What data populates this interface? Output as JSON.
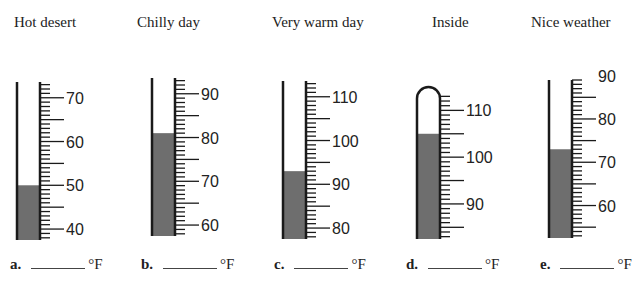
{
  "fill_color": "#6e6e6e",
  "line_color": "#1a1a1a",
  "thermometers": [
    {
      "id": "a",
      "title": "Hot desert",
      "letter": "a.",
      "unit": "°F",
      "reading": 50,
      "scale_min": 37.5,
      "scale_max": 73.6,
      "labels": [
        "70",
        "60",
        "50",
        "40"
      ],
      "label_values": [
        70,
        60,
        50,
        40
      ],
      "tube_left": 17,
      "scale_x": 40,
      "top_y": 82,
      "bottom_y": 240,
      "rounded_top": false
    },
    {
      "id": "b",
      "title": "Chilly day",
      "letter": "b.",
      "unit": "°F",
      "reading": 81,
      "scale_min": 57.5,
      "scale_max": 93.6,
      "labels": [
        "90",
        "80",
        "70",
        "60"
      ],
      "label_values": [
        90,
        80,
        70,
        60
      ],
      "tube_left": 152,
      "scale_x": 175,
      "top_y": 78,
      "bottom_y": 236,
      "rounded_top": false
    },
    {
      "id": "c",
      "title": "Very warm day",
      "letter": "c.",
      "unit": "°F",
      "reading": 93,
      "scale_min": 77.5,
      "scale_max": 113.6,
      "labels": [
        "110",
        "100",
        "90",
        "80"
      ],
      "label_values": [
        110,
        100,
        90,
        80
      ],
      "tube_left": 283,
      "scale_x": 306,
      "top_y": 81,
      "bottom_y": 239,
      "rounded_top": false
    },
    {
      "id": "d",
      "title": "Inside",
      "letter": "d.",
      "unit": "°F",
      "reading": 105,
      "scale_min": 82.5,
      "scale_max": 115,
      "labels": [
        "110",
        "100",
        "90"
      ],
      "label_values": [
        110,
        100,
        90
      ],
      "tube_left": 417,
      "scale_x": 440,
      "top_y": 87,
      "bottom_y": 239,
      "rounded_top": true
    },
    {
      "id": "e",
      "title": "Nice weather",
      "letter": "e.",
      "unit": "°F",
      "reading": 73,
      "scale_min": 52.5,
      "scale_max": 89,
      "labels": [
        "90",
        "80",
        "70",
        "60"
      ],
      "label_values": [
        90,
        80,
        70,
        60
      ],
      "tube_left": 549,
      "scale_x": 572,
      "top_y": 80,
      "bottom_y": 238,
      "rounded_top": false
    }
  ],
  "answers": [
    {
      "letter": "a.",
      "unit": "°F"
    },
    {
      "letter": "b.",
      "unit": "°F"
    },
    {
      "letter": "c.",
      "unit": "°F"
    },
    {
      "letter": "d.",
      "unit": "°F"
    },
    {
      "letter": "e.",
      "unit": "°F"
    }
  ]
}
